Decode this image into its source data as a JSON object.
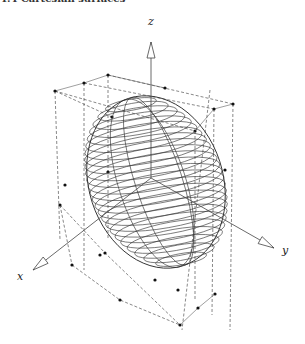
{
  "caption": "4.4 Cartesian surfaces",
  "axes": {
    "x_label": "x",
    "y_label": "y",
    "z_label": "z"
  },
  "figure": {
    "origin": [
      151,
      178
    ],
    "z_axis": {
      "from": [
        151,
        178
      ],
      "to": [
        151,
        42
      ],
      "label_pos": [
        148,
        25
      ]
    },
    "y_axis": {
      "from": [
        151,
        178
      ],
      "to": [
        274,
        248
      ],
      "label_pos": [
        282,
        254
      ]
    },
    "x_axis": {
      "from": [
        151,
        178
      ],
      "to": [
        33,
        270
      ],
      "label_pos": [
        17,
        280
      ]
    },
    "ellipsoid": {
      "cx": 156,
      "cy": 182,
      "rx": 67,
      "ry": 88,
      "tilt_deg": -18,
      "rings": 26
    },
    "box_top": [
      [
        55,
        91
      ],
      [
        84,
        83
      ],
      [
        108,
        75
      ],
      [
        165,
        88
      ],
      [
        233,
        104
      ],
      [
        214,
        109
      ],
      [
        195,
        131
      ],
      [
        112,
        117
      ]
    ],
    "box_bottom": [
      [
        60,
        205
      ],
      [
        72,
        265
      ],
      [
        105,
        253
      ],
      [
        120,
        300
      ],
      [
        180,
        325
      ],
      [
        198,
        308
      ],
      [
        215,
        294
      ],
      [
        155,
        280
      ]
    ],
    "colors": {
      "stroke": "#333333",
      "dash": "#555555",
      "dot": "#111111"
    }
  }
}
